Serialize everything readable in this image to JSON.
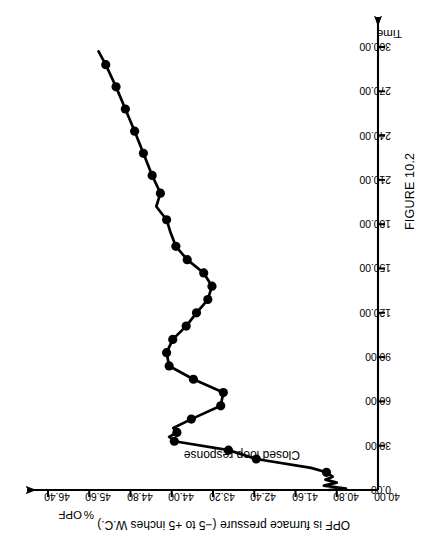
{
  "figure": {
    "caption": "FIGURE 10.2",
    "title": "OPF is furnace pressure (−5 to +5 inches W.C.)",
    "series_note": "Closed loop response"
  },
  "chart_data": {
    "type": "line",
    "title": "OPF is furnace pressure (−5 to +5 inches W.C.)",
    "annotations": [
      "Closed loop response"
    ],
    "xlabel": "Time",
    "ylabel": "OPF",
    "ylabel_units": "%",
    "xlim": [
      0.0,
      300.0
    ],
    "ylim": [
      40.0,
      46.4
    ],
    "grid": false,
    "legend": "none",
    "orientation": "rotated-90",
    "xticks": [
      "0.00",
      "30.00",
      "60.00",
      "90.00",
      "120.00",
      "150.00",
      "180.00",
      "210.00",
      "240.00",
      "270.00",
      "300.00"
    ],
    "xtick_values": [
      0,
      30,
      60,
      90,
      120,
      150,
      180,
      210,
      240,
      270,
      300
    ],
    "yticks": [
      "40.00",
      "40.80",
      "41.60",
      "42.40",
      "43.20",
      "44.00",
      "44.80",
      "45.60",
      "46.40"
    ],
    "ytick_values": [
      40.0,
      40.8,
      41.6,
      42.4,
      43.2,
      44.0,
      44.8,
      45.6,
      46.4
    ],
    "series": [
      {
        "name": "Closed loop response",
        "marker": "filled-circle",
        "line_color": "#000000",
        "x": [
          0,
          1,
          3,
          5,
          7,
          9,
          12,
          15,
          21,
          27,
          33,
          36,
          39,
          42,
          48,
          57,
          66,
          75,
          84,
          93,
          102,
          111,
          120,
          129,
          138,
          147,
          156,
          165,
          174,
          183,
          192,
          201,
          213,
          228,
          243,
          258,
          273,
          288,
          297
        ],
        "y": [
          40.95,
          40.62,
          41.05,
          40.8,
          41.02,
          40.88,
          41.0,
          41.3,
          42.36,
          42.9,
          43.95,
          44.05,
          43.9,
          43.97,
          43.62,
          43.05,
          43.0,
          43.58,
          44.05,
          44.1,
          43.98,
          43.72,
          43.52,
          43.3,
          43.22,
          43.38,
          43.7,
          43.92,
          44.02,
          44.1,
          44.3,
          44.22,
          44.38,
          44.55,
          44.72,
          44.9,
          45.08,
          45.28,
          45.42
        ],
        "marker_x": [
          12,
          21,
          27,
          33,
          39,
          48,
          57,
          66,
          75,
          84,
          93,
          102,
          111,
          120,
          129,
          138,
          147,
          156,
          165,
          183,
          201,
          213,
          228,
          243,
          258,
          273,
          288
        ],
        "marker_y": [
          41.0,
          42.36,
          42.9,
          43.95,
          43.9,
          43.62,
          43.05,
          43.0,
          43.58,
          44.05,
          44.1,
          43.98,
          43.72,
          43.52,
          43.3,
          43.22,
          43.38,
          43.7,
          43.92,
          44.1,
          44.22,
          44.38,
          44.55,
          44.72,
          44.9,
          45.08,
          45.28
        ]
      }
    ]
  },
  "axes": {
    "value_axis_name": "OPF",
    "value_axis_units": "%",
    "time_axis_name": "Time"
  }
}
